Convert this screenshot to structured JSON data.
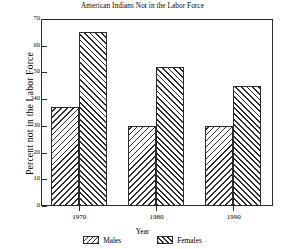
{
  "chart_data": {
    "type": "bar",
    "title": "American Indians Not in the Labor Force",
    "xlabel": "Year",
    "ylabel": "Percent not in the Labor Force",
    "categories": [
      "1970",
      "1980",
      "1990"
    ],
    "series": [
      {
        "name": "Males",
        "values": [
          37,
          30,
          30
        ]
      },
      {
        "name": "Females",
        "values": [
          65,
          52,
          45
        ]
      }
    ],
    "ylim": [
      0,
      70
    ],
    "yticks": [
      0,
      10,
      20,
      30,
      40,
      50,
      60,
      70
    ],
    "ytick_labels": [
      "0",
      "10",
      "20",
      "30",
      "40",
      "50",
      "60",
      "70"
    ],
    "grid": false,
    "legend_position": "bottom",
    "legend": [
      {
        "label": "Males",
        "pattern": "backslash-hatch",
        "swatch": "males-swatch-icon"
      },
      {
        "label": "Females",
        "pattern": "forwardslash-hatch",
        "swatch": "females-swatch-icon"
      }
    ],
    "colors": {
      "hatch": "#2b2b2b",
      "fill": "#ffffff",
      "axis": "#2b2b2b",
      "text": "#000000",
      "background": "#ffffff"
    }
  }
}
